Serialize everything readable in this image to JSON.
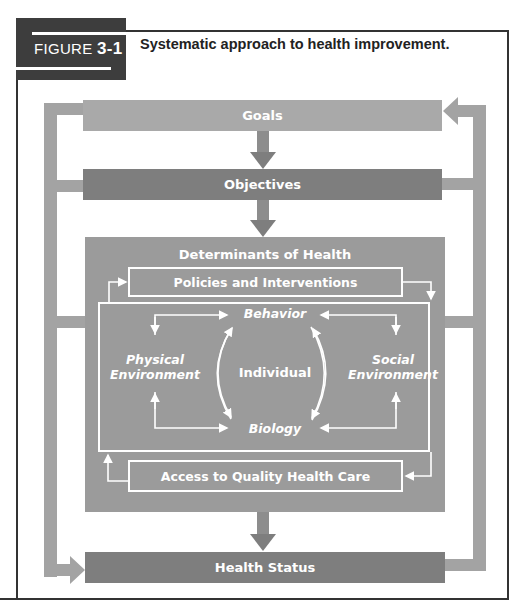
{
  "figure": {
    "label_prefix": "FIGURE",
    "label_number": "3-1",
    "caption": "Systematic approach to health improvement."
  },
  "diagram": {
    "goals": "Goals",
    "objectives": "Objectives",
    "determinants_title": "Determinants of Health",
    "policies": "Policies and Interventions",
    "behavior": "Behavior",
    "individual": "Individual",
    "biology": "Biology",
    "physical_env_line1": "Physical",
    "physical_env_line2": "Environment",
    "social_env_line1": "Social",
    "social_env_line2": "Environment",
    "access": "Access to Quality Health Care",
    "health_status": "Health Status"
  },
  "colors": {
    "label_bg": "#3d3d3d",
    "light_bar": "#a9a9a9",
    "dark_bar": "#7e7e7e",
    "determinants_bg": "#9b9b9b",
    "loop": "#a3a3a3"
  }
}
